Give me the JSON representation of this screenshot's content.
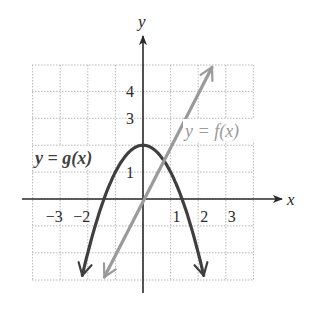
{
  "chart_data": {
    "type": "line",
    "title": "",
    "xlabel": "x",
    "ylabel": "y",
    "xlim": [
      -4,
      4
    ],
    "ylim": [
      -3,
      5
    ],
    "grid": true,
    "x_ticks": [
      {
        "value": -3,
        "label": "−3"
      },
      {
        "value": -2,
        "label": "−2"
      },
      {
        "value": 1,
        "label": "1"
      },
      {
        "value": 2,
        "label": "2"
      },
      {
        "value": 3,
        "label": "3"
      }
    ],
    "y_ticks": [
      {
        "value": 1,
        "label": "1"
      },
      {
        "value": 3,
        "label": "3"
      },
      {
        "value": 4,
        "label": "4"
      }
    ],
    "series": [
      {
        "name": "y = g(x)",
        "label_main": "y = g",
        "label_paren": "(x)",
        "description": "downward parabola, vertex (0,2), x-intercepts about ±1.4",
        "color": "#3f3f3f",
        "x": [
          -2.2,
          -2,
          -1.5,
          -1,
          -0.5,
          0,
          0.5,
          1,
          1.5,
          2,
          2.2
        ],
        "y": [
          -2.84,
          -2,
          -0.25,
          1,
          1.75,
          2,
          1.75,
          1,
          -0.25,
          -2,
          -2.84
        ]
      },
      {
        "name": "y = f(x)",
        "label_main": "y = f",
        "label_paren": "(x)",
        "description": "line with slope 2 through approximately the origin",
        "color": "#9a9a9a",
        "x": [
          -1.4,
          0,
          2.5
        ],
        "y": [
          -2.9,
          0.1,
          4.9
        ]
      }
    ]
  },
  "axes": {
    "x_label": "x",
    "y_label": "y"
  }
}
